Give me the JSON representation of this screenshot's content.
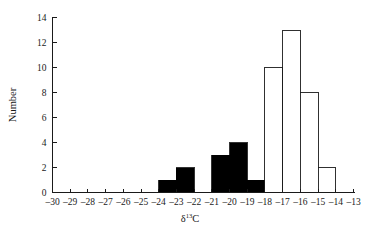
{
  "chart_data": {
    "type": "bar",
    "title": "",
    "subtitle": "",
    "xlabel": "δ¹³C",
    "xlabel_base": "δ",
    "xlabel_sup": "13",
    "xlabel_tail": "C",
    "ylabel": "Number",
    "xlim": [
      -30,
      -13
    ],
    "ylim": [
      0,
      14
    ],
    "grid": false,
    "legend": "none",
    "bin_width": 1,
    "x_tick_labels": [
      "–30",
      "–29",
      "–28",
      "–27",
      "–26",
      "–25",
      "–24",
      "–23",
      "–22",
      "–21",
      "–20",
      "–19",
      "–18",
      "–17",
      "–16",
      "–15",
      "–14",
      "–13"
    ],
    "x_tick_values": [
      -30,
      -29,
      -28,
      -27,
      -26,
      -25,
      -24,
      -23,
      -22,
      -21,
      -20,
      -19,
      -18,
      -17,
      -16,
      -15,
      -14,
      -13
    ],
    "y_tick_labels": [
      "0",
      "2",
      "4",
      "6",
      "8",
      "10",
      "12",
      "14"
    ],
    "y_tick_values": [
      0,
      2,
      4,
      6,
      8,
      10,
      12,
      14
    ],
    "categories": [
      "–30 to –29",
      "–29 to –28",
      "–28 to –27",
      "–27 to –26",
      "–26 to –25",
      "–25 to –24",
      "–24 to –23",
      "–23 to –22",
      "–22 to –21",
      "–21 to –20",
      "–20 to –19",
      "–19 to –18",
      "–18 to –17",
      "–17 to –16",
      "–16 to –15",
      "–15 to –14",
      "–14 to –13"
    ],
    "values": [
      0,
      0,
      0,
      0,
      0,
      0,
      1,
      2,
      0,
      3,
      4,
      1,
      10,
      13,
      8,
      2,
      0
    ],
    "bins": [
      {
        "x0": -30,
        "x1": -29,
        "value": 0,
        "style": "filled"
      },
      {
        "x0": -29,
        "x1": -28,
        "value": 0,
        "style": "filled"
      },
      {
        "x0": -28,
        "x1": -27,
        "value": 0,
        "style": "filled"
      },
      {
        "x0": -27,
        "x1": -26,
        "value": 0,
        "style": "filled"
      },
      {
        "x0": -26,
        "x1": -25,
        "value": 0,
        "style": "filled"
      },
      {
        "x0": -25,
        "x1": -24,
        "value": 0,
        "style": "filled"
      },
      {
        "x0": -24,
        "x1": -23,
        "value": 1,
        "style": "filled"
      },
      {
        "x0": -23,
        "x1": -22,
        "value": 2,
        "style": "filled"
      },
      {
        "x0": -22,
        "x1": -21,
        "value": 0,
        "style": "filled"
      },
      {
        "x0": -21,
        "x1": -20,
        "value": 3,
        "style": "filled"
      },
      {
        "x0": -20,
        "x1": -19,
        "value": 4,
        "style": "filled"
      },
      {
        "x0": -19,
        "x1": -18,
        "value": 1,
        "style": "filled"
      },
      {
        "x0": -18,
        "x1": -17,
        "value": 10,
        "style": "open"
      },
      {
        "x0": -17,
        "x1": -16,
        "value": 13,
        "style": "open"
      },
      {
        "x0": -16,
        "x1": -15,
        "value": 8,
        "style": "open"
      },
      {
        "x0": -15,
        "x1": -14,
        "value": 2,
        "style": "open"
      },
      {
        "x0": -14,
        "x1": -13,
        "value": 0,
        "style": "open"
      }
    ],
    "series": [
      {
        "name": "filled",
        "color": "#000000",
        "values": [
          0,
          0,
          0,
          0,
          0,
          0,
          1,
          2,
          0,
          3,
          4,
          1,
          null,
          null,
          null,
          null,
          null
        ]
      },
      {
        "name": "open",
        "color": "#ffffff",
        "values": [
          null,
          null,
          null,
          null,
          null,
          null,
          null,
          null,
          null,
          null,
          null,
          null,
          10,
          13,
          8,
          2,
          0
        ]
      }
    ],
    "colors": {
      "filled_bar": "#000000",
      "open_bar_fill": "#ffffff",
      "open_bar_stroke": "#1a1a1a",
      "axis": "#1a1a1a",
      "background": "#ffffff"
    }
  }
}
